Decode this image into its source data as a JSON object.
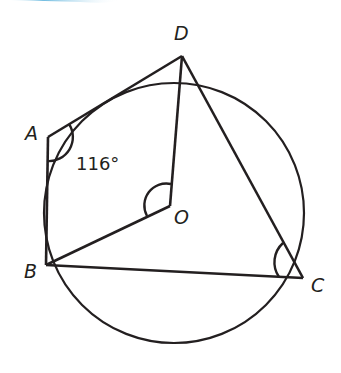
{
  "diagram": {
    "type": "circle-theorem",
    "points": {
      "A": {
        "label": "A",
        "x": 48,
        "y": 137
      },
      "B": {
        "label": "B",
        "x": 46,
        "y": 265
      },
      "C": {
        "label": "C",
        "x": 303,
        "y": 278
      },
      "D": {
        "label": "D",
        "x": 182,
        "y": 56
      },
      "O": {
        "label": "O",
        "x": 170,
        "y": 206
      }
    },
    "circle": {
      "cx": 174,
      "cy": 213,
      "r": 130
    },
    "angle_label": "116°",
    "colors": {
      "stroke": "#231f20",
      "top_bar": "#7fc4e0"
    }
  }
}
